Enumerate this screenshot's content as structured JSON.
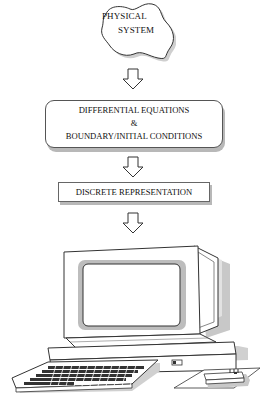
{
  "diagram": {
    "nodes": [
      {
        "id": "physical-system",
        "shape": "cloud-blob",
        "lines": [
          "PHYSICAL",
          "SYSTEM"
        ]
      },
      {
        "id": "differential-equations",
        "shape": "rounded-rectangle",
        "lines": [
          "DIFFERENTIAL EQUATIONS",
          "&",
          "BOUNDARY/INITIAL CONDITIONS"
        ]
      },
      {
        "id": "discrete-representation",
        "shape": "rectangle",
        "lines": [
          "DISCRETE REPRESENTATION"
        ]
      },
      {
        "id": "computer",
        "shape": "illustration",
        "label": "desktop computer with monitor, keyboard and modem"
      }
    ],
    "edges": [
      {
        "from": "physical-system",
        "to": "differential-equations",
        "style": "hollow-down-arrow"
      },
      {
        "from": "differential-equations",
        "to": "discrete-representation",
        "style": "hollow-down-arrow"
      },
      {
        "from": "discrete-representation",
        "to": "computer",
        "style": "hollow-down-arrow"
      }
    ]
  },
  "colors": {
    "stroke": "#333333",
    "shadow": "#b8b8b8",
    "background": "#ffffff"
  }
}
